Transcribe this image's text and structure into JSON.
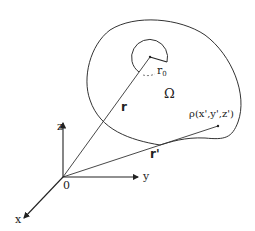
{
  "diagram": {
    "type": "vector-geometry",
    "axes": {
      "x_label": "x",
      "y_label": "y",
      "z_label": "z",
      "origin_label": "0"
    },
    "vectors": {
      "r_label": "r",
      "r_prime_label": "r'"
    },
    "region_label": "Ω",
    "radius_label": "r",
    "radius_subscript": "0",
    "point_label": "ρ(x',y',z')",
    "colors": {
      "stroke": "#333333",
      "background": "#ffffff"
    }
  }
}
